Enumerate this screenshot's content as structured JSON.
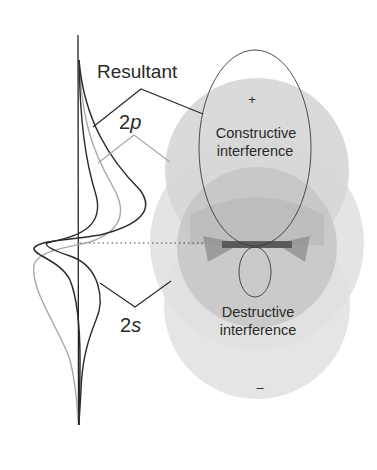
{
  "diagram": {
    "labels": {
      "resultant": "Resultant",
      "orbital_2p_number": "2",
      "orbital_2p_letter": "p",
      "orbital_2s_number": "2",
      "orbital_2s_letter": "s",
      "constructive_line1": "Constructive",
      "constructive_line2": "interference",
      "destructive_line1": "Destructive",
      "destructive_line2": "interference",
      "plus_sign": "+",
      "minus_sign": "–"
    },
    "colors": {
      "background": "#ffffff",
      "line_dark": "#2b2b2b",
      "line_gray": "#a8a8a8",
      "shade_light": "#e2e2e2",
      "shade_mid": "#cfcfcf",
      "shade_dark": "#b2b2b2",
      "shade_darkest": "#7e7e7e"
    }
  }
}
